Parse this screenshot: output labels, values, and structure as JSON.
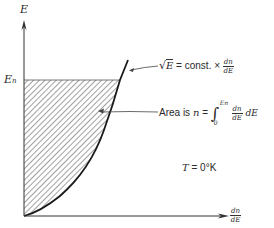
{
  "diagram": {
    "y_axis": {
      "label": "E"
    },
    "x_axis": {
      "label_num": "dn",
      "label_den": "dE"
    },
    "level_label": {
      "main": "E",
      "sub": "n"
    },
    "curve_annotation": {
      "sqrt_arg": "E",
      "equals_text": " = const. × ",
      "frac_num": "dn",
      "frac_den": "dE"
    },
    "area_annotation": {
      "prefix": "Area is ",
      "var": "n",
      "equals": " = ",
      "int_upper": "En",
      "int_lower": "0",
      "frac_num": "dn",
      "frac_den": "dE",
      "suffix": " dE"
    },
    "temperature": {
      "var": "T",
      "value": " = 0°K"
    },
    "colors": {
      "ink": "#2a2a2a",
      "hatch": "#6e6e6e",
      "background": "#ffffff"
    }
  }
}
